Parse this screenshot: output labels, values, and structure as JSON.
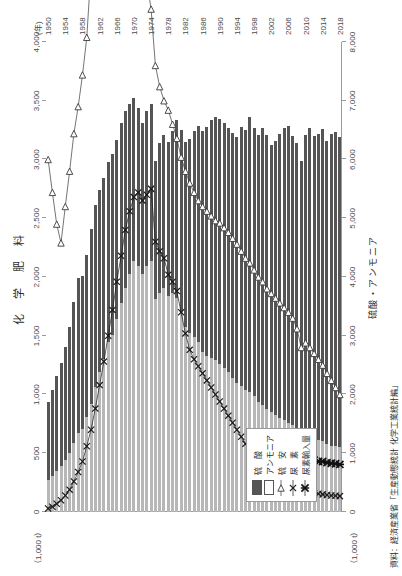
{
  "title": "化 学 肥 料",
  "unit_top": "（1,000 t）",
  "unit_bottom": "（1,000 t）",
  "axis_bottom_title": "硫酸・アンモニア",
  "year_axis_unit": "(年)",
  "source": "資料：経済産業省「生産動態統計 化学工業統計編」",
  "legend": {
    "items": [
      {
        "label": "硫　酸",
        "key": "bar-filled",
        "color": "#555555"
      },
      {
        "label": "アンモニア",
        "key": "bar-hollow",
        "color": "#ffffff"
      },
      {
        "label": "硫　安",
        "key": "triangle-open",
        "color": "#3a3a3a"
      },
      {
        "label": "尿　素",
        "key": "cross",
        "color": "#1a1a1a"
      },
      {
        "label": "尿素輸入量",
        "key": "cross-bold",
        "color": "#111111"
      }
    ]
  },
  "chart_data": {
    "type": "bar",
    "title": "化 学 肥 料",
    "xlabel": "(年)",
    "ylabel_bars": "硫酸・アンモニア",
    "ylabel_lines": "化学肥料",
    "unit": "1,000 t",
    "grid": false,
    "legend_position": "bottom-left",
    "axis_bars": {
      "range": [
        0,
        8000
      ],
      "ticks": [
        0,
        1000,
        2000,
        3000,
        4000,
        5000,
        6000,
        7000,
        8000
      ],
      "ticklabels": [
        "0",
        "1,000",
        "2,000",
        "3,000",
        "4,000",
        "5,000",
        "6,000",
        "7,000",
        "8,000"
      ],
      "position": "bottom"
    },
    "axis_lines": {
      "range": [
        0,
        4000
      ],
      "ticks": [
        0,
        500,
        1000,
        1500,
        2000,
        2500,
        3000,
        3500,
        4000
      ],
      "ticklabels": [
        "0",
        "500",
        "1,000",
        "1,500",
        "2,000",
        "2,500",
        "3,000",
        "3,500",
        "4,000"
      ],
      "position": "top"
    },
    "x": [
      1950,
      1951,
      1952,
      1953,
      1954,
      1955,
      1956,
      1957,
      1958,
      1959,
      1960,
      1961,
      1962,
      1963,
      1964,
      1965,
      1966,
      1967,
      1968,
      1969,
      1970,
      1971,
      1972,
      1973,
      1974,
      1975,
      1976,
      1977,
      1978,
      1979,
      1980,
      1981,
      1982,
      1983,
      1984,
      1985,
      1986,
      1987,
      1988,
      1989,
      1990,
      1991,
      1992,
      1993,
      1994,
      1995,
      1996,
      1997,
      1998,
      1999,
      2000,
      2001,
      2002,
      2003,
      2004,
      2005,
      2006,
      2007,
      2008,
      2009,
      2010,
      2011,
      2012,
      2013,
      2014,
      2015,
      2016,
      2017,
      2018
    ],
    "xticklabels": [
      "1950",
      "1954",
      "1958",
      "1962",
      "1966",
      "1970",
      "1974",
      "1978",
      "1982",
      "1986",
      "1990",
      "1994",
      "1998",
      "2002",
      "2006",
      "2010",
      "2014",
      "2018"
    ],
    "series": [
      {
        "name": "硫　酸",
        "type": "bar",
        "axis": "bars",
        "color": "#555555",
        "values": [
          1870,
          2080,
          2320,
          2540,
          2810,
          3150,
          3580,
          3980,
          4020,
          4380,
          4820,
          5230,
          5480,
          5690,
          5950,
          6090,
          6340,
          6620,
          6820,
          6950,
          7050,
          6880,
          6620,
          6830,
          6950,
          5980,
          6280,
          6420,
          6300,
          6480,
          6670,
          6510,
          6290,
          6350,
          6480,
          6570,
          6480,
          6550,
          6680,
          6720,
          6690,
          6620,
          6540,
          6450,
          6390,
          6560,
          6500,
          6720,
          6540,
          6410,
          6530,
          6420,
          6250,
          6320,
          6430,
          6540,
          6570,
          6400,
          6280,
          5970,
          6420,
          6530,
          6400,
          6430,
          6520,
          6320,
          6440,
          6470,
          6380
        ]
      },
      {
        "name": "アンモニア",
        "type": "bar",
        "axis": "bars",
        "color": "#b7b7b7",
        "values": [
          540,
          610,
          690,
          790,
          890,
          1010,
          1180,
          1350,
          1420,
          1620,
          1840,
          2120,
          2380,
          2610,
          2890,
          3020,
          3280,
          3550,
          3820,
          4050,
          4280,
          4180,
          4050,
          4190,
          4280,
          3620,
          3720,
          3820,
          3680,
          3720,
          3650,
          3420,
          3150,
          3050,
          2980,
          2890,
          2720,
          2650,
          2620,
          2580,
          2520,
          2450,
          2380,
          2280,
          2200,
          2150,
          2080,
          2040,
          1970,
          1880,
          1820,
          1760,
          1700,
          1650,
          1600,
          1560,
          1520,
          1480,
          1400,
          1250,
          1300,
          1280,
          1240,
          1220,
          1200,
          1150,
          1130,
          1120,
          1100
        ]
      },
      {
        "name": "硫　安",
        "type": "line",
        "marker": "triangle-open",
        "axis": "lines",
        "color": "#3a3a3a",
        "values": [
          3000,
          2720,
          2450,
          2290,
          2600,
          2900,
          3220,
          3450,
          3720,
          4040,
          4620,
          4880,
          5020,
          5100,
          5220,
          5250,
          5280,
          5300,
          5160,
          5050,
          5080,
          4950,
          4700,
          4520,
          4280,
          3800,
          3620,
          3500,
          3420,
          3300,
          3180,
          3020,
          2900,
          2800,
          2720,
          2650,
          2600,
          2560,
          2520,
          2480,
          2460,
          2420,
          2380,
          2330,
          2280,
          2220,
          2160,
          2120,
          2060,
          2000,
          1960,
          1900,
          1860,
          1820,
          1780,
          1740,
          1700,
          1650,
          1560,
          1400,
          1440,
          1400,
          1350,
          1300,
          1250,
          1180,
          1120,
          1060,
          1000
        ]
      },
      {
        "name": "尿　素",
        "type": "line",
        "marker": "cross",
        "axis": "lines",
        "color": "#1a1a1a",
        "values": [
          30,
          45,
          70,
          100,
          140,
          190,
          260,
          340,
          430,
          560,
          700,
          880,
          1080,
          1280,
          1500,
          1720,
          1960,
          2180,
          2400,
          2560,
          2680,
          2720,
          2650,
          2700,
          2750,
          2300,
          2220,
          2160,
          2020,
          1960,
          1880,
          1700,
          1520,
          1380,
          1300,
          1240,
          1180,
          1120,
          1060,
          1000,
          940,
          880,
          820,
          760,
          700,
          640,
          580,
          520,
          460,
          400,
          360,
          320,
          290,
          270,
          250,
          230,
          215,
          200,
          190,
          175,
          170,
          165,
          160,
          155,
          150,
          145,
          140,
          138,
          135
        ]
      },
      {
        "name": "尿素輸入量",
        "type": "line",
        "marker": "cross-bold",
        "axis": "lines",
        "color": "#111111",
        "values": [
          0,
          0,
          0,
          0,
          0,
          0,
          0,
          0,
          0,
          0,
          0,
          0,
          0,
          0,
          0,
          0,
          0,
          0,
          0,
          0,
          0,
          0,
          0,
          0,
          0,
          0,
          0,
          0,
          0,
          0,
          0,
          0,
          0,
          0,
          0,
          0,
          0,
          0,
          0,
          0,
          0,
          0,
          0,
          0,
          0,
          0,
          0,
          0,
          210,
          260,
          300,
          340,
          360,
          380,
          400,
          420,
          430,
          440,
          450,
          400,
          440,
          450,
          440,
          430,
          430,
          420,
          415,
          410,
          405
        ]
      }
    ]
  }
}
